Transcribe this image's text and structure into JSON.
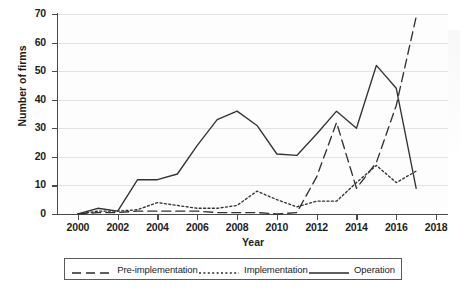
{
  "chart_data": {
    "type": "line",
    "title": "",
    "xlabel": "Year",
    "ylabel": "Number of firms",
    "xlim": [
      1999,
      2018.6
    ],
    "ylim": [
      0,
      70
    ],
    "xticks": [
      2000,
      2002,
      2004,
      2006,
      2008,
      2010,
      2012,
      2014,
      2016,
      2018
    ],
    "yticks": [
      0,
      10,
      20,
      30,
      40,
      50,
      60,
      70
    ],
    "grid": "horizontal",
    "legend_position": "below",
    "x": [
      2000,
      2001,
      2002,
      2003,
      2004,
      2005,
      2006,
      2007,
      2008,
      2009,
      2010,
      2011,
      2012,
      2013,
      2014,
      2015,
      2016,
      2017
    ],
    "series": [
      {
        "name": "Pre-implementation",
        "style": "dashed",
        "color": "#333333",
        "values": [
          0,
          0.5,
          0.5,
          1,
          1,
          1,
          1,
          0.5,
          0.5,
          0.5,
          0,
          0.5,
          13,
          32,
          9,
          18,
          38,
          69
        ]
      },
      {
        "name": "Implementation",
        "style": "dotted",
        "color": "#333333",
        "values": [
          0,
          1,
          1,
          1.5,
          4,
          3,
          2,
          2,
          3,
          8,
          5,
          2.5,
          4.5,
          4.5,
          11,
          17,
          11,
          15
        ]
      },
      {
        "name": "Operation",
        "style": "solid",
        "color": "#333333",
        "values": [
          0,
          2,
          1,
          12,
          12,
          14,
          24,
          33,
          36,
          31,
          21,
          20.5,
          28,
          36,
          30,
          52,
          44,
          9
        ]
      }
    ]
  },
  "legend": {
    "items": [
      {
        "label": "Pre-implementation",
        "style": "dashed"
      },
      {
        "label": "Implementation",
        "style": "dotted"
      },
      {
        "label": "Operation",
        "style": "solid"
      }
    ]
  },
  "artifacts": {
    "side_note": ""
  }
}
